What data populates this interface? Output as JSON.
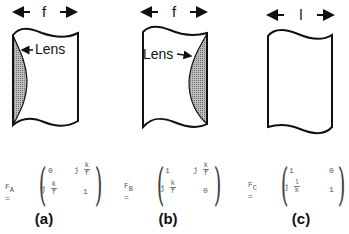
{
  "panels": [
    {
      "id": "a",
      "caption": "(a)",
      "dimension_label": "f",
      "lens_label": "Lens",
      "lens_side": "left",
      "matrix": {
        "name": "F",
        "subscript": "A",
        "equals": "=",
        "cells": {
          "r1c1": "0",
          "r1c2": {
            "prefix": "j",
            "num": "k",
            "den": "f"
          },
          "r2c1": {
            "prefix": "j",
            "num": "k",
            "den": "f"
          },
          "r2c2": "1"
        }
      }
    },
    {
      "id": "b",
      "caption": "(b)",
      "dimension_label": "f",
      "lens_label": "Lens",
      "lens_side": "right",
      "matrix": {
        "name": "F",
        "subscript": "B",
        "equals": "=",
        "cells": {
          "r1c1": "1",
          "r1c2": {
            "prefix": "j",
            "num": "k",
            "den": "f"
          },
          "r2c1": {
            "prefix": "j",
            "num": "k",
            "den": "f"
          },
          "r2c2": "0"
        }
      }
    },
    {
      "id": "c",
      "caption": "(c)",
      "dimension_label": "l",
      "lens_label": "",
      "lens_side": "none",
      "matrix": {
        "name": "F",
        "subscript": "C",
        "equals": "=",
        "cells": {
          "r1c1": "1",
          "r1c2": "0",
          "r2c1": {
            "prefix": "j",
            "num": "l",
            "den": "k"
          },
          "r2c2": "1"
        }
      }
    }
  ],
  "colors": {
    "ink": "#111111",
    "lens_fill": "#8a8a8a",
    "matrix_text": "#555555"
  }
}
